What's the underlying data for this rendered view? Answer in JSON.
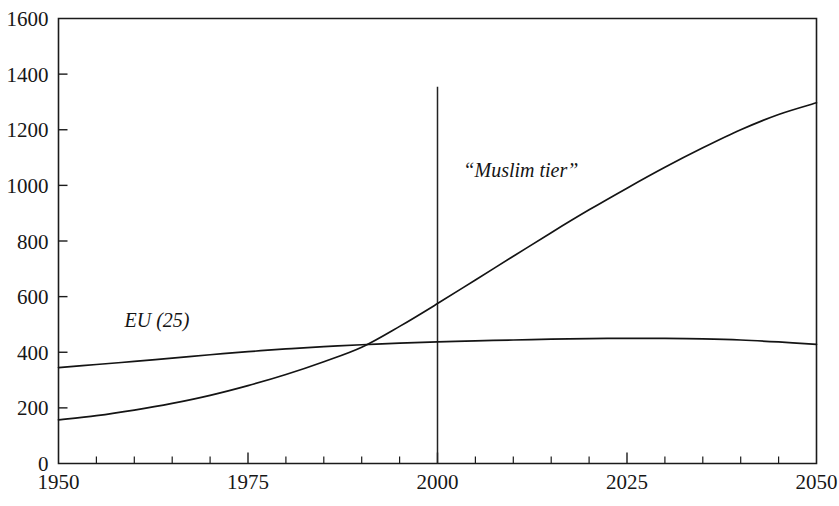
{
  "chart_data": {
    "type": "line",
    "title": "",
    "subtitle": "",
    "xlabel": "",
    "ylabel": "",
    "xlim": [
      1950,
      2050
    ],
    "ylim": [
      0,
      1600
    ],
    "grid": false,
    "legend": "inline-annotations",
    "x_ticks_major": [
      1950,
      1975,
      2000,
      2025,
      2050
    ],
    "x_ticks_major_labels": [
      "1950",
      "1975",
      "2000",
      "2025",
      "2050"
    ],
    "x_ticks_minor_step": 5,
    "y_ticks": [
      0,
      200,
      400,
      600,
      800,
      1000,
      1200,
      1400,
      1600
    ],
    "y_tick_labels": [
      "0",
      "200",
      "400",
      "600",
      "800",
      "1000",
      "1200",
      "1400",
      "1600"
    ],
    "annotations": [
      {
        "name": "present-day-marker",
        "type": "vertical-line",
        "x": 2000,
        "y_from": 0,
        "y_to": 1355
      }
    ],
    "series": [
      {
        "name": "EU (25)",
        "label": "EU (25)",
        "label_x": 1963,
        "label_y": 490,
        "x": [
          1950,
          1955,
          1960,
          1965,
          1970,
          1975,
          1980,
          1985,
          1990,
          1995,
          2000,
          2005,
          2010,
          2015,
          2020,
          2025,
          2030,
          2035,
          2040,
          2045,
          2050
        ],
        "values": [
          345,
          356,
          367,
          379,
          391,
          402,
          412,
          420,
          427,
          433,
          437,
          441,
          444,
          447,
          449,
          450,
          450,
          448,
          444,
          437,
          428
        ]
      },
      {
        "name": "“Muslim tier”",
        "label": "“Muslim tier”",
        "label_x": 2011,
        "label_y": 1030,
        "x": [
          1950,
          1955,
          1960,
          1965,
          1970,
          1975,
          1980,
          1985,
          1990,
          1995,
          2000,
          2005,
          2010,
          2015,
          2020,
          2025,
          2030,
          2035,
          2040,
          2045,
          2050
        ],
        "values": [
          157,
          172,
          192,
          216,
          245,
          280,
          320,
          366,
          418,
          493,
          575,
          660,
          745,
          830,
          912,
          990,
          1065,
          1135,
          1200,
          1255,
          1297
        ]
      }
    ]
  },
  "figure": {
    "background_color": "#ffffff",
    "ink_color": "#141414"
  }
}
